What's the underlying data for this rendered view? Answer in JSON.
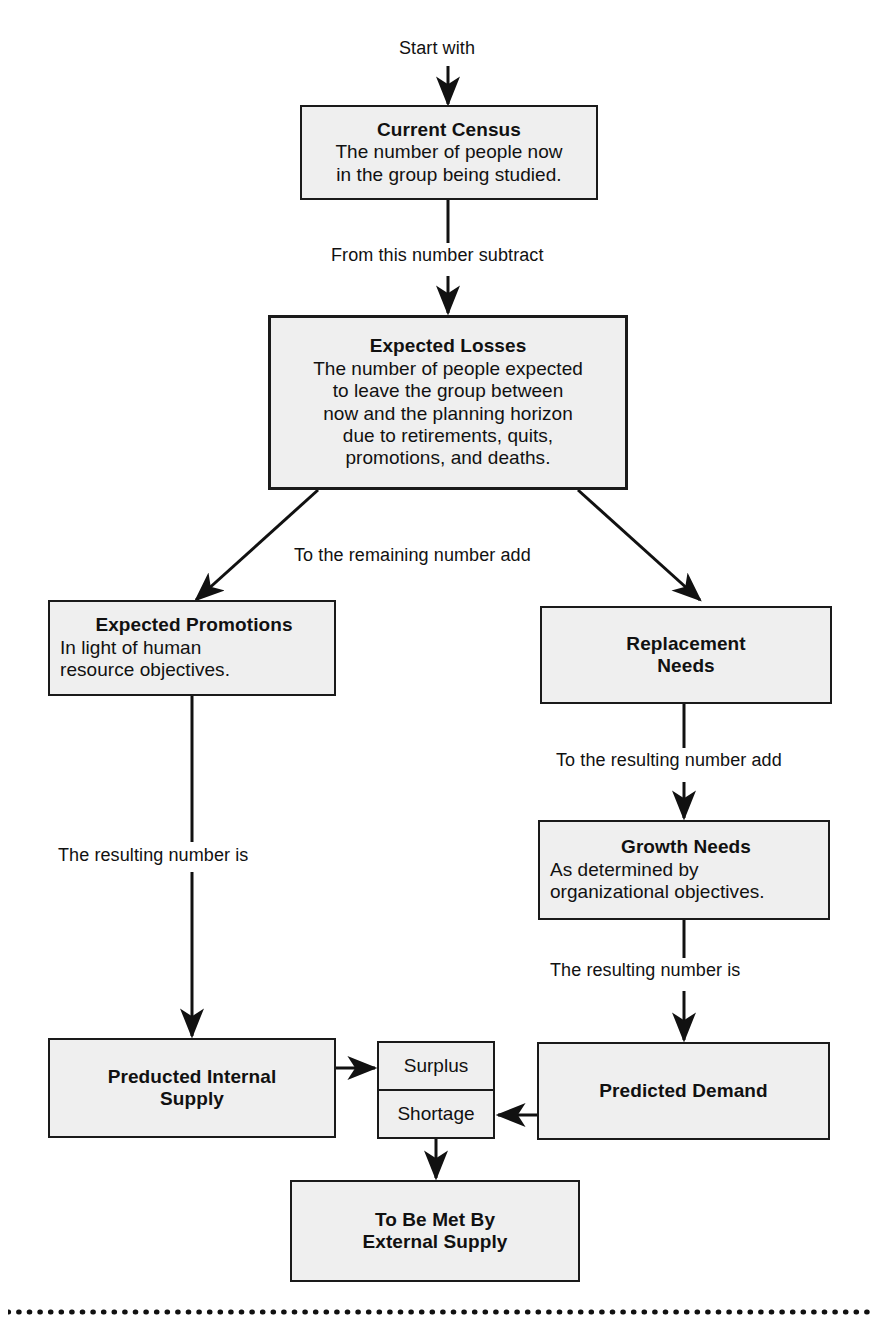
{
  "diagram": {
    "kind": "flowchart"
  },
  "nodes": {
    "current_census": {
      "title": "Current Census",
      "body": "The number of people now\nin the group being studied."
    },
    "expected_losses": {
      "title": "Expected Losses",
      "body": "The number of people expected\nto leave the group between\nnow and the planning horizon\ndue to retirements, quits,\npromotions, and deaths."
    },
    "expected_promotions": {
      "title": "Expected Promotions",
      "body": "In light of human\nresource objectives."
    },
    "replacement_needs": {
      "title": "Replacement\nNeeds",
      "body": ""
    },
    "growth_needs": {
      "title": "Growth Needs",
      "body": "As determined by\norganizational objectives."
    },
    "predicted_internal_supply": {
      "title": "Preducted Internal\nSupply",
      "body": ""
    },
    "predicted_demand": {
      "title": "Predicted Demand",
      "body": ""
    },
    "external_supply": {
      "title": "To Be Met By\nExternal Supply",
      "body": ""
    }
  },
  "decision": {
    "surplus_label": "Surplus",
    "shortage_label": "Shortage"
  },
  "captions": {
    "start_with": "Start with",
    "from_this_number_subtract": "From this number subtract",
    "to_the_remaining_number_add": "To the remaining number add",
    "to_the_resulting_number_add": "To the resulting number add",
    "the_resulting_number_is_left": "The resulting number is",
    "the_resulting_number_is_right": "The resulting number is"
  },
  "colors": {
    "box_fill": "#efefef",
    "line": "#1a1a1a",
    "text": "#111111",
    "page_background": "#ffffff"
  }
}
